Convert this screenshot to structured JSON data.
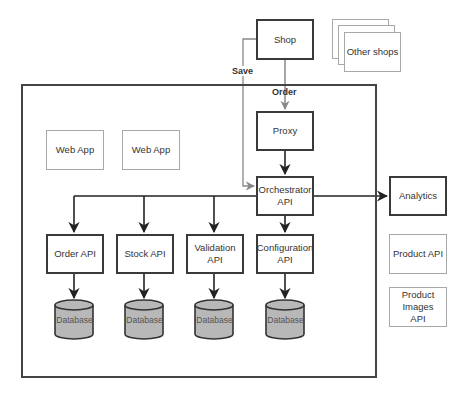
{
  "diagram": {
    "nodes": {
      "shop": "Shop",
      "other_shops": "Other shops",
      "proxy": "Proxy",
      "orchestrator": "Orchestrator API",
      "analytics": "Analytics",
      "web_app_1": "Web App",
      "web_app_2": "Web App",
      "order_api": "Order API",
      "stock_api": "Stock API",
      "validation_api": "Validation API",
      "configuration_api": "Configuration API",
      "product_api": "Product API",
      "product_images_api": "Product Images API"
    },
    "databases": [
      "Database",
      "Database",
      "Database",
      "Database"
    ],
    "edge_labels": {
      "save": "Save",
      "order": "Order"
    },
    "edges": [
      {
        "from": "Shop",
        "to": "Proxy",
        "label": "Order",
        "color": "#777777"
      },
      {
        "from": "Shop",
        "to": "Orchestrator API",
        "label": "Save",
        "color": "#888888"
      },
      {
        "from": "Proxy",
        "to": "Orchestrator API",
        "color": "#222222"
      },
      {
        "from": "Orchestrator API",
        "to": "Analytics",
        "color": "#222222"
      },
      {
        "from": "Orchestrator API",
        "to": "Order API",
        "color": "#222222"
      },
      {
        "from": "Orchestrator API",
        "to": "Stock API",
        "color": "#222222"
      },
      {
        "from": "Orchestrator API",
        "to": "Validation API",
        "color": "#222222"
      },
      {
        "from": "Orchestrator API",
        "to": "Configuration API",
        "color": "#222222"
      },
      {
        "from": "Order API",
        "to": "Database",
        "color": "#222222"
      },
      {
        "from": "Stock API",
        "to": "Database",
        "color": "#222222"
      },
      {
        "from": "Validation API",
        "to": "Database",
        "color": "#222222"
      },
      {
        "from": "Configuration API",
        "to": "Database",
        "color": "#222222"
      }
    ],
    "colors": {
      "solid_border": "#3a3a3a",
      "light_border": "#a8a8a8",
      "database_fill": "#b8b8b8"
    }
  }
}
